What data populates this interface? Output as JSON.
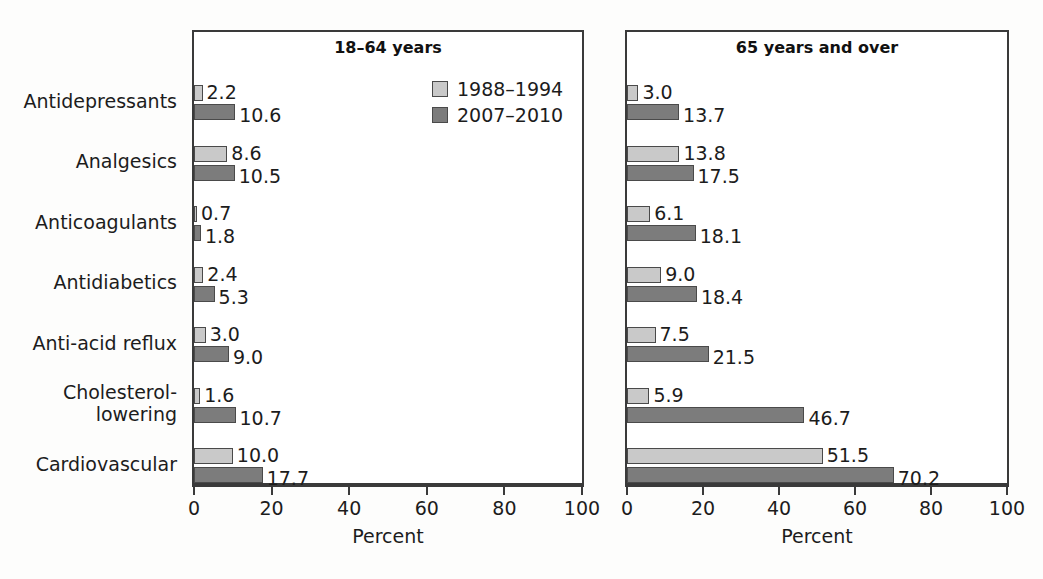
{
  "chart_data": {
    "type": "bar",
    "orientation": "horizontal",
    "title": "",
    "xlabel": "Percent",
    "ylabel": "",
    "xlim": [
      0,
      100
    ],
    "xticks": [
      0,
      20,
      40,
      60,
      80,
      100
    ],
    "grid": false,
    "legend_position": "top-right of left panel",
    "categories": [
      "Antidepressants",
      "Analgesics",
      "Anticoagulants",
      "Antidiabetics",
      "Anti-acid reflux",
      "Cholesterol-\nlowering",
      "Cardiovascular"
    ],
    "series_names": [
      "1988–1994",
      "2007–2010"
    ],
    "panels": [
      {
        "title": "18–64 years",
        "xlabel": "Percent",
        "series": [
          {
            "name": "1988–1994",
            "values": [
              2.2,
              8.6,
              0.7,
              2.4,
              3.0,
              1.6,
              10.0
            ]
          },
          {
            "name": "2007–2010",
            "values": [
              10.6,
              10.5,
              1.8,
              5.3,
              9.0,
              10.7,
              17.7
            ]
          }
        ]
      },
      {
        "title": "65 years and over",
        "xlabel": "Percent",
        "series": [
          {
            "name": "1988–1994",
            "values": [
              3.0,
              13.8,
              6.1,
              9.0,
              7.5,
              5.9,
              51.5
            ]
          },
          {
            "name": "2007–2010",
            "values": [
              13.7,
              17.5,
              18.1,
              18.4,
              21.5,
              46.7,
              70.2
            ]
          }
        ]
      }
    ],
    "value_labels": {
      "18-64 years": {
        "1988–1994": [
          "2.2",
          "8.6",
          "0.7",
          "2.4",
          "3.0",
          "1.6",
          "10.0"
        ],
        "2007–2010": [
          "10.6",
          "10.5",
          "1.8",
          "5.3",
          "9.0",
          "10.7",
          "17.7"
        ]
      },
      "65 years and over": {
        "1988–1994": [
          "3.0",
          "13.8",
          "6.1",
          "9.0",
          "7.5",
          "5.9",
          "51.5"
        ],
        "2007–2010": [
          "13.7",
          "17.5",
          "18.1",
          "18.4",
          "21.5",
          "46.7",
          "70.2"
        ]
      }
    },
    "colors": {
      "series_1988_1994": "#c9c9c9",
      "series_2007_2010": "#7c7c7c",
      "bar_outline": "#4a4a4a",
      "axis": "#3a3a3a",
      "text": "#1c1c1c",
      "background": "#ffffff"
    }
  },
  "legend": {
    "entries": [
      {
        "label": "1988–1994",
        "swatch": "light-gray-swatch-icon"
      },
      {
        "label": "2007–2010",
        "swatch": "dark-gray-swatch-icon"
      }
    ]
  },
  "axis": {
    "tick_labels": [
      "0",
      "20",
      "40",
      "60",
      "80",
      "100"
    ],
    "title": "Percent"
  },
  "panel_titles": {
    "left": "18–64 years",
    "right": "65 years and over"
  }
}
